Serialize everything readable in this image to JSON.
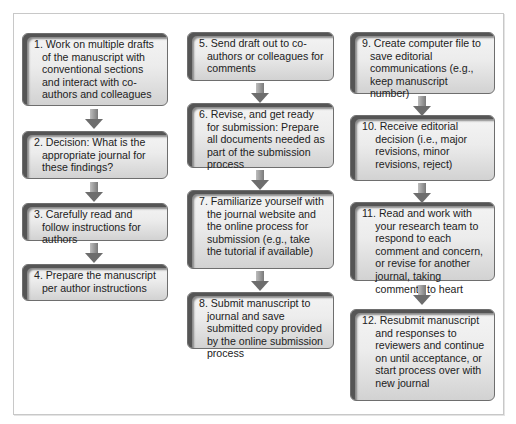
{
  "diagram": {
    "type": "flowchart",
    "columns": [
      {
        "steps": [
          {
            "id": 1,
            "text": "1. Work on multiple drafts of the manuscript with conventional sections and interact with co-authors and colleagues"
          },
          {
            "id": 2,
            "text": "2. Decision: What is the appropriate journal for these findings?"
          },
          {
            "id": 3,
            "text": "3. Carefully read and follow instructions for authors"
          },
          {
            "id": 4,
            "text": "4. Prepare the manuscript per author instructions"
          }
        ]
      },
      {
        "steps": [
          {
            "id": 5,
            "text": "5. Send draft out to co-authors or colleagues for comments"
          },
          {
            "id": 6,
            "text": "6. Revise, and get ready for submission: Prepare all documents needed as part of the submission process"
          },
          {
            "id": 7,
            "text": "7. Familiarize yourself with the journal website and the online process for submission (e.g., take the tutorial if available)"
          },
          {
            "id": 8,
            "text": "8. Submit manuscript to journal and save submitted copy provided by the online submission process"
          }
        ]
      },
      {
        "steps": [
          {
            "id": 9,
            "text": "9. Create computer file to save editorial communications (e.g., keep manuscript number)"
          },
          {
            "id": 10,
            "text": "10. Receive editorial decision (i.e., major revisions, minor revisions, reject)"
          },
          {
            "id": 11,
            "text": "11. Read and work with your research team to respond to each comment and concern, or revise for another journal, taking comments to heart"
          },
          {
            "id": 12,
            "text": "12. Resubmit manuscript and responses to reviewers and continue on until acceptance, or start process over with new journal"
          }
        ]
      }
    ],
    "colors": {
      "box_border": "#6e6e6e",
      "box_fill": "#ececec",
      "arrow": "#7a7a7a",
      "frame": "#c8c8c8"
    }
  }
}
